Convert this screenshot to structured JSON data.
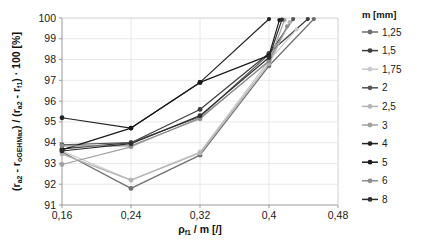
{
  "chart_data": {
    "type": "line",
    "title": "",
    "xlabel": "ρf1 / m [/]",
    "ylabel": "(ra2 - roGEHMax) / (ra2 - rf1) · 100 [%]",
    "xlim": [
      0.16,
      0.48
    ],
    "ylim": [
      91,
      100
    ],
    "xticks": [
      "0,16",
      "0,24",
      "0,32",
      "0,4",
      "0,48"
    ],
    "xtick_values": [
      0.16,
      0.24,
      0.32,
      0.4,
      0.48
    ],
    "yticks": [
      "91",
      "92",
      "93",
      "94",
      "95",
      "96",
      "97",
      "98",
      "99",
      "100"
    ],
    "ytick_values": [
      91,
      92,
      93,
      94,
      95,
      96,
      97,
      98,
      99,
      100
    ],
    "grid": true,
    "legend_position": "right",
    "legend_title": "m [mm]",
    "series": [
      {
        "name": "1,25",
        "color": "#6e6e6e",
        "x": [
          0.16,
          0.24,
          0.32,
          0.4,
          0.452
        ],
        "values": [
          93.55,
          91.8,
          93.4,
          97.7,
          99.95
        ]
      },
      {
        "name": "1,5",
        "color": "#3c3c3c",
        "x": [
          0.16,
          0.24,
          0.32,
          0.4,
          0.445
        ],
        "values": [
          93.7,
          94.0,
          95.6,
          98.3,
          99.95
        ]
      },
      {
        "name": "1,75",
        "color": "#c9c9c9",
        "x": [
          0.16,
          0.24,
          0.32,
          0.4,
          0.432
        ],
        "values": [
          93.6,
          92.2,
          93.55,
          97.95,
          99.45
        ]
      },
      {
        "name": "2",
        "color": "#555555",
        "x": [
          0.16,
          0.24,
          0.32,
          0.4,
          0.428
        ],
        "values": [
          93.9,
          94.0,
          95.25,
          98.25,
          99.95
        ]
      },
      {
        "name": "2,5",
        "color": "#b4b4b4",
        "x": [
          0.16,
          0.24,
          0.32,
          0.4,
          0.424
        ],
        "values": [
          93.45,
          92.2,
          93.5,
          97.8,
          99.8
        ]
      },
      {
        "name": "3",
        "color": "#a0a0a0",
        "x": [
          0.16,
          0.24,
          0.32,
          0.4,
          0.418
        ],
        "values": [
          92.95,
          93.8,
          95.2,
          97.9,
          99.9
        ]
      },
      {
        "name": "4",
        "color": "#242424",
        "x": [
          0.16,
          0.24,
          0.32,
          0.4
        ],
        "values": [
          95.2,
          94.7,
          96.9,
          99.95
        ]
      },
      {
        "name": "5",
        "color": "#1a1a1a",
        "x": [
          0.16,
          0.24,
          0.32,
          0.4,
          0.412
        ],
        "values": [
          93.65,
          94.7,
          96.9,
          98.2,
          99.9
        ]
      },
      {
        "name": "6",
        "color": "#8c8c8c",
        "x": [
          0.16,
          0.24,
          0.32,
          0.4,
          0.421
        ],
        "values": [
          93.85,
          93.85,
          95.15,
          97.95,
          99.6
        ]
      },
      {
        "name": "8",
        "color": "#2e2e2e",
        "x": [
          0.16,
          0.24,
          0.32,
          0.4,
          0.415
        ],
        "values": [
          93.6,
          93.95,
          95.3,
          98.1,
          99.92
        ]
      }
    ]
  }
}
